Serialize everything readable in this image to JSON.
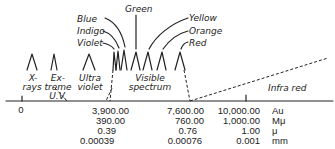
{
  "colors": {
    "ink": "#222222",
    "background": "#ffffff"
  },
  "color_labels": {
    "blue": "Blue",
    "indigo": "Indigo",
    "violet": "Violet",
    "green": "Green",
    "yellow": "Yellow",
    "orange": "Orange",
    "red": "Red"
  },
  "regions": {
    "xrays_1": "X-",
    "xrays_2": "rays",
    "extreme_1": "Ex-",
    "extreme_2": "treme",
    "extreme_3": "U.V.",
    "ultra_1": "Ultra",
    "ultra_2": "violet",
    "visible_1": "Visible",
    "visible_2": "spectrum",
    "infrared": "Infra red"
  },
  "axis": {
    "zero": "0",
    "columns": [
      {
        "values": [
          "3,900.00",
          "390.00",
          "0.39",
          "0.00039"
        ]
      },
      {
        "values": [
          "7,600.00",
          "760.00",
          "0.76",
          "0.00076"
        ]
      },
      {
        "values": [
          "10,000.00",
          "1,000.00",
          "1.00",
          "0.001"
        ]
      }
    ],
    "units": [
      "Au",
      "Mμ",
      "μ",
      "mm"
    ]
  }
}
